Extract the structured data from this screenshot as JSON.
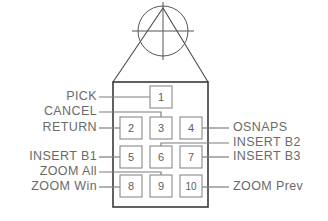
{
  "diagram": {
    "colors": {
      "background": "#ffffff",
      "outline": "#4b4b4b",
      "button_border": "#8a8a8a",
      "text": "#6a6a6a",
      "leader": "#7d7d7d"
    },
    "crosshair": {
      "name": "crosshair-lens",
      "cx": 163,
      "cy": 31,
      "r": 25
    },
    "buttons": [
      {
        "id": "button-1",
        "label": "1",
        "x": 150,
        "y": 86,
        "w": 22,
        "h": 22
      },
      {
        "id": "button-2",
        "label": "2",
        "x": 120,
        "y": 117,
        "w": 22,
        "h": 22
      },
      {
        "id": "button-3",
        "label": "3",
        "x": 150,
        "y": 117,
        "w": 22,
        "h": 22
      },
      {
        "id": "button-4",
        "label": "4",
        "x": 180,
        "y": 117,
        "w": 22,
        "h": 22
      },
      {
        "id": "button-5",
        "label": "5",
        "x": 120,
        "y": 146,
        "w": 22,
        "h": 22
      },
      {
        "id": "button-6",
        "label": "6",
        "x": 150,
        "y": 146,
        "w": 22,
        "h": 22
      },
      {
        "id": "button-7",
        "label": "7",
        "x": 180,
        "y": 146,
        "w": 22,
        "h": 22
      },
      {
        "id": "button-8",
        "label": "8",
        "x": 120,
        "y": 175,
        "w": 22,
        "h": 22
      },
      {
        "id": "button-9",
        "label": "9",
        "x": 150,
        "y": 175,
        "w": 22,
        "h": 22
      },
      {
        "id": "button-10",
        "label": "10",
        "x": 180,
        "y": 175,
        "w": 22,
        "h": 22
      }
    ],
    "callouts": [
      {
        "id": "callout-pick",
        "text": "PICK",
        "side": "left",
        "tx": 95,
        "ty": 97,
        "target": "button-1"
      },
      {
        "id": "callout-cancel",
        "text": "CANCEL",
        "side": "left",
        "tx": 95,
        "ty": 112,
        "target": "button-3"
      },
      {
        "id": "callout-return",
        "text": "RETURN",
        "side": "left",
        "tx": 95,
        "ty": 128,
        "target": "button-2"
      },
      {
        "id": "callout-insert-b1",
        "text": "INSERT  B1",
        "side": "left",
        "tx": 95,
        "ty": 157,
        "target": "button-5"
      },
      {
        "id": "callout-zoom-all",
        "text": "ZOOM  All",
        "side": "left",
        "tx": 95,
        "ty": 172,
        "target": "button-9"
      },
      {
        "id": "callout-zoom-win",
        "text": "ZOOM  Win",
        "side": "left",
        "tx": 95,
        "ty": 187,
        "target": "button-8"
      },
      {
        "id": "callout-osnaps",
        "text": "OSNAPS",
        "side": "right",
        "tx": 233,
        "ty": 128,
        "target": "button-4"
      },
      {
        "id": "callout-insert-b2",
        "text": "INSERT  B2",
        "side": "right",
        "tx": 233,
        "ty": 143,
        "target": "button-6"
      },
      {
        "id": "callout-insert-b3",
        "text": "INSERT  B3",
        "side": "right",
        "tx": 233,
        "ty": 157,
        "target": "button-7"
      },
      {
        "id": "callout-zoom-prev",
        "text": "ZOOM  Prev",
        "side": "right",
        "tx": 233,
        "ty": 187,
        "target": "button-10"
      }
    ]
  }
}
